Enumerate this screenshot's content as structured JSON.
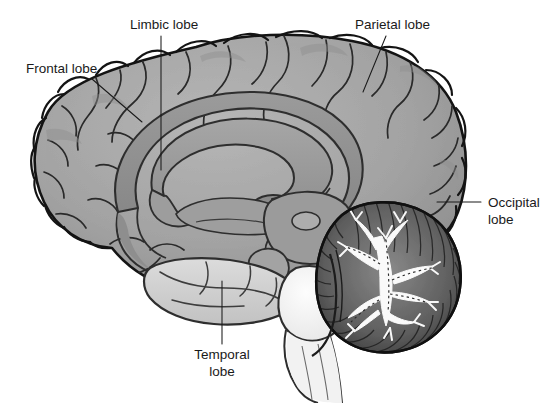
{
  "figure": {
    "view": "midsagittal",
    "background_color": "#ffffff",
    "line_color": "#1a1a1a"
  },
  "palette": {
    "cortex_gray": "#a2a2a2",
    "cortex_shadow": "#8c8c8c",
    "cortex_highlight": "#b4b4b4",
    "limbic_gray": "#8e8e8e",
    "corpus_callosum": "#9a9a9a",
    "temporal_light": "#cfcfcf",
    "brainstem_white": "#f4f4f4",
    "cerebellum_dark": "#6e6e6e",
    "cerebellum_white": "#fbfbfb",
    "outline": "#1a1a1a"
  },
  "labels": [
    {
      "id": "frontal-lobe",
      "text": "Frontal lobe",
      "lines": [
        "Frontal lobe"
      ],
      "x": 26,
      "y": 73,
      "anchor": "start",
      "leader": {
        "x1": 92,
        "y1": 79,
        "x2": 142,
        "y2": 122
      }
    },
    {
      "id": "limbic-lobe",
      "text": "Limbic lobe",
      "lines": [
        "Limbic lobe"
      ],
      "x": 130,
      "y": 29,
      "anchor": "start",
      "leader": {
        "x1": 161,
        "y1": 36,
        "x2": 161,
        "y2": 170
      }
    },
    {
      "id": "parietal-lobe",
      "text": "Parietal lobe",
      "lines": [
        "Parietal lobe"
      ],
      "x": 355,
      "y": 29,
      "anchor": "start",
      "leader": {
        "x1": 386,
        "y1": 36,
        "x2": 363,
        "y2": 92
      }
    },
    {
      "id": "occipital-lobe",
      "text": "Occipital lobe",
      "lines": [
        "Occipital",
        "lobe"
      ],
      "x": 488,
      "y": 207,
      "anchor": "start",
      "leader": {
        "x1": 481,
        "y1": 202,
        "x2": 437,
        "y2": 202
      }
    },
    {
      "id": "temporal-lobe",
      "text": "Temporal lobe",
      "lines": [
        "Temporal",
        "lobe"
      ],
      "x": 222,
      "y": 359,
      "anchor": "middle",
      "leader": {
        "x1": 222,
        "y1": 281,
        "x2": 222,
        "y2": 344
      }
    }
  ],
  "structures": [
    {
      "id": "cerebral-cortex",
      "name": "Cerebral cortex"
    },
    {
      "id": "corpus-callosum",
      "name": "Corpus callosum"
    },
    {
      "id": "cingulate-gyrus",
      "name": "Cingulate gyrus (limbic lobe)"
    },
    {
      "id": "thalamus",
      "name": "Thalamus"
    },
    {
      "id": "brainstem",
      "name": "Brainstem"
    },
    {
      "id": "cerebellum",
      "name": "Cerebellum"
    },
    {
      "id": "arbor-vitae",
      "name": "Arbor vitae"
    },
    {
      "id": "temporal-lobe-body",
      "name": "Temporal lobe"
    }
  ]
}
